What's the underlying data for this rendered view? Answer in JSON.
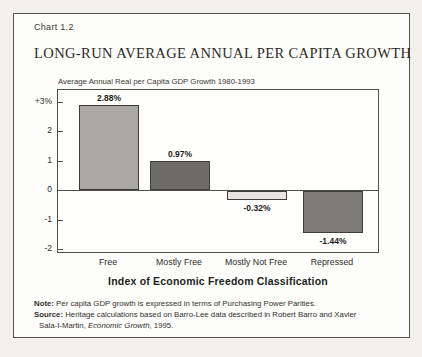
{
  "header": {
    "chart_number": "Chart 1.2"
  },
  "chart_data": {
    "type": "bar",
    "title": "LONG-RUN AVERAGE ANNUAL PER CAPITA GROWTH",
    "subtitle": "Average Annual Real per Capita GDP Growth 1980-1993",
    "xlabel": "Index of Economic Freedom Classification",
    "ylabel": "",
    "categories": [
      "Free",
      "Mostly Free",
      "Mostly Not Free",
      "Repressed"
    ],
    "values": [
      2.88,
      0.97,
      -0.32,
      -1.44
    ],
    "value_labels": [
      "2.88%",
      "0.97%",
      "-0.32%",
      "-1.44%"
    ],
    "bar_colors": [
      "#a9a8a5",
      "#6d6c6a",
      "#e6e5e1",
      "#7c7b78"
    ],
    "yticks": [
      {
        "value": 3,
        "label": "+3%"
      },
      {
        "value": 2,
        "label": "2"
      },
      {
        "value": 1,
        "label": "1"
      },
      {
        "value": 0,
        "label": "0"
      },
      {
        "value": -1,
        "label": "-1"
      },
      {
        "value": -2,
        "label": "-2"
      }
    ],
    "ylim": [
      -2.15,
      3.4
    ],
    "grid": false,
    "legend_position": "none"
  },
  "notes": {
    "note_label": "Note:",
    "note_text": " Per capita GDP growth is expressed in terms of Purchasing Power Parities.",
    "source_label": "Source:",
    "source_text": " Heritage calculations based on Barro-Lee data described in Robert Barro and Xavier",
    "source_line2_pre": "Sala-I-Martin, ",
    "source_line2_italic": "Economic Growth",
    "source_line2_post": ", 1995."
  },
  "colors": {
    "paper_background": "#f3f1ec",
    "card_background": "#fdfdfb",
    "frame_border": "#55534e",
    "text": "#2c2a27"
  }
}
